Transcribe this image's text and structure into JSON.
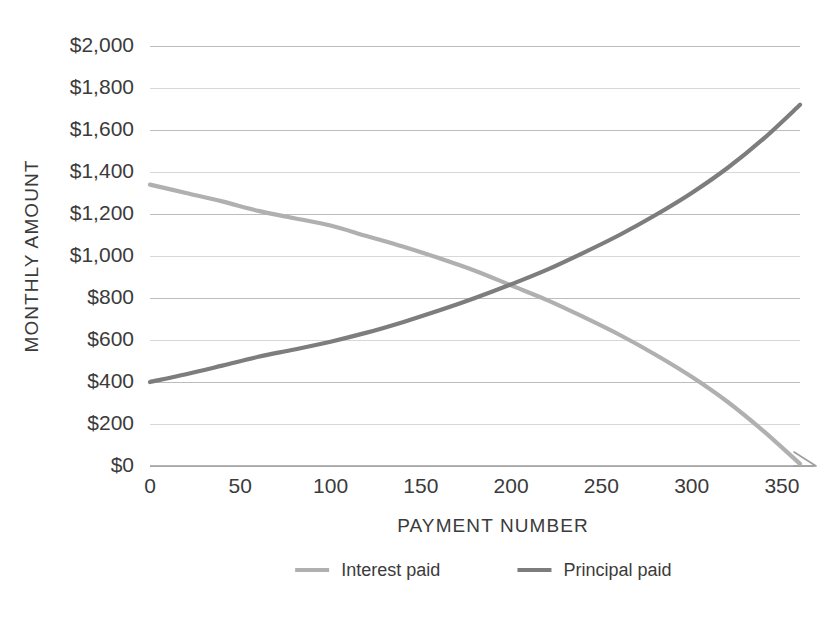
{
  "chart_data": {
    "type": "line",
    "title": "",
    "xlabel": "PAYMENT NUMBER",
    "ylabel": "MONTHLY AMOUNT",
    "xlim": [
      0,
      360
    ],
    "ylim": [
      0,
      2000
    ],
    "grid": true,
    "legend_position": "bottom",
    "x_ticks": [
      0,
      50,
      100,
      150,
      200,
      250,
      300,
      350
    ],
    "x_tick_labels": [
      "0",
      "50",
      "100",
      "150",
      "200",
      "250",
      "300",
      "350"
    ],
    "y_ticks": [
      0,
      200,
      400,
      600,
      800,
      1000,
      1200,
      1400,
      1600,
      1800,
      2000
    ],
    "y_tick_labels": [
      "$0",
      "$200",
      "$400",
      "$600",
      "$800",
      "$1,000",
      "$1,200",
      "$1,400",
      "$1,600",
      "$1,800",
      "$2,000"
    ],
    "x": [
      0,
      20,
      40,
      60,
      80,
      100,
      120,
      140,
      160,
      180,
      200,
      220,
      240,
      260,
      280,
      300,
      320,
      340,
      360
    ],
    "series": [
      {
        "name": "Interest paid",
        "color": "#b0b0b0",
        "values": [
          1340,
          1300,
          1260,
          1215,
          1180,
          1145,
          1095,
          1045,
          990,
          930,
          860,
          790,
          710,
          625,
          530,
          425,
          305,
          165,
          10
        ]
      },
      {
        "name": "Principal paid",
        "color": "#7d7d7d",
        "values": [
          400,
          437,
          478,
          520,
          555,
          592,
          635,
          685,
          740,
          800,
          865,
          935,
          1015,
          1100,
          1195,
          1300,
          1420,
          1560,
          1720
        ]
      }
    ],
    "annotations": {
      "crossover_payment": 190,
      "crossover_amount": 870
    }
  },
  "legend": {
    "items": [
      {
        "label": "Interest paid",
        "color": "#b0b0b0"
      },
      {
        "label": "Principal paid",
        "color": "#7d7d7d"
      }
    ]
  },
  "colors": {
    "interest": "#b0b0b0",
    "principal": "#7d7d7d",
    "grid": "#b9b9b9",
    "axis": "#9e9e9e",
    "text": "#3b3b3b",
    "background": "#ffffff"
  }
}
